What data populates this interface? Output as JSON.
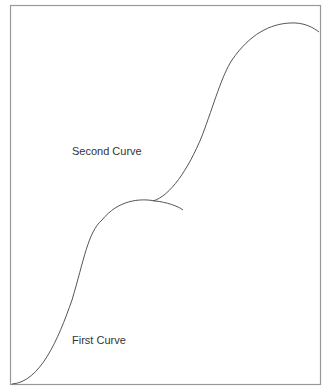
{
  "diagram": {
    "frame_color": "#888888",
    "curve_color": "#555555",
    "labels": {
      "first": "First Curve",
      "second": "Second Curve"
    }
  }
}
